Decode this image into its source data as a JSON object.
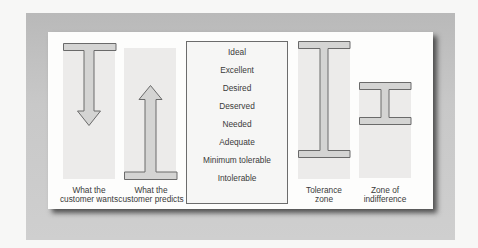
{
  "diagram": {
    "columns": [
      {
        "id": "customer-wants",
        "caption_line1": "What the",
        "caption_line2": "customer wants",
        "symbol": "down-arrow-from-bar"
      },
      {
        "id": "customer-predicts",
        "caption_line1": "What the",
        "caption_line2": "customer predicts",
        "symbol": "up-arrow-to-bar"
      },
      {
        "id": "tolerance-zone",
        "caption_line1": "Tolerance",
        "caption_line2": "zone",
        "symbol": "tall-i-beam"
      },
      {
        "id": "zone-of-indifference",
        "caption_line1": "Zone of",
        "caption_line2": "indifference",
        "symbol": "short-i-beam"
      }
    ],
    "expectation_levels": [
      "Ideal",
      "Excellent",
      "Desired",
      "Deserved",
      "Needed",
      "Adequate",
      "Minimum tolerable",
      "Intolerable"
    ],
    "colors": {
      "shape_fill": "#d4d4d3",
      "shape_stroke": "#6a6a6a",
      "frame": "#c4c4c4",
      "card": "#fdfdfc",
      "text": "#3a3a3a"
    }
  }
}
